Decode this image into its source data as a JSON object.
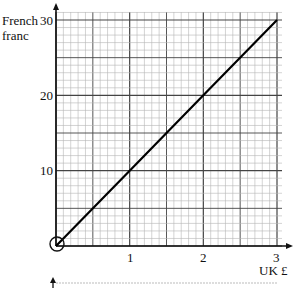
{
  "chart_data": {
    "type": "line",
    "title": "",
    "xlabel": "UK £",
    "ylabel": "French franc",
    "xlim": [
      0,
      3
    ],
    "ylim": [
      0,
      30
    ],
    "x_ticks": [
      "1",
      "2",
      "3"
    ],
    "y_ticks": [
      "10",
      "20",
      "30"
    ],
    "grid": true,
    "series": [
      {
        "name": "conversion",
        "x": [
          0,
          1,
          2,
          3
        ],
        "values": [
          0,
          10,
          20,
          30
        ]
      }
    ],
    "annotations": [
      "circle at origin"
    ]
  },
  "labels": {
    "y_title_line1": "French",
    "y_title_line2": "franc",
    "x_title": "UK £",
    "y30": "30",
    "y20": "20",
    "y10": "10",
    "x1": "1",
    "x2": "2",
    "x3": "3"
  }
}
